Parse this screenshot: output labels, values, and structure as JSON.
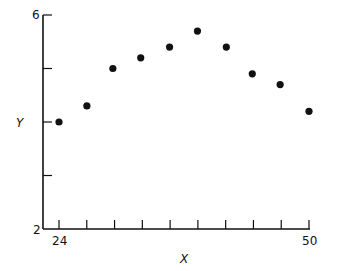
{
  "chart_data": {
    "type": "scatter",
    "title": "",
    "xlabel": "X",
    "ylabel": "Y",
    "xlim": [
      24,
      50
    ],
    "ylim": [
      2,
      6
    ],
    "x_tick_labels": [
      "24",
      "50"
    ],
    "y_tick_labels": [
      "2",
      "6"
    ],
    "x_ticks_count": 10,
    "y_ticks": [
      2,
      3,
      4,
      5,
      6
    ],
    "grid": false,
    "legend": null,
    "x": [
      24,
      26.9,
      29.6,
      32.5,
      35.5,
      38.4,
      41.4,
      44.1,
      47.0,
      50
    ],
    "y": [
      4.0,
      4.3,
      5.0,
      5.2,
      5.4,
      5.7,
      5.4,
      4.9,
      4.7,
      4.2
    ],
    "marker_color": "#111111"
  },
  "labels": {
    "y_top": "6",
    "y_bottom": "2",
    "x_left": "24",
    "x_right": "50",
    "x_axis_title": "X",
    "y_axis_title": "Y"
  }
}
